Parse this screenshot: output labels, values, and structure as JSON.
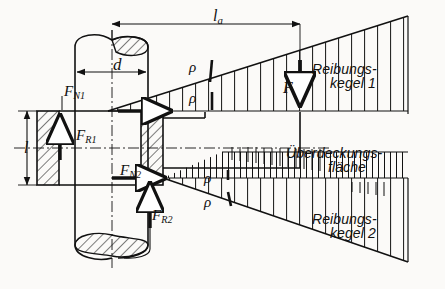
{
  "figure": {
    "kind": "technical-drawing",
    "background_color": "#fbfaf8",
    "line_color": "#111111"
  },
  "dimensions": {
    "la": {
      "text": "l",
      "sub": "a",
      "meaning": "Abstand / overhang length",
      "x": 213,
      "y": 12
    },
    "d": {
      "text": "d",
      "sub": "",
      "meaning": "Wellendurchmesser / shaft diameter",
      "x": 118,
      "y": 62
    },
    "l": {
      "text": "l",
      "sub": "",
      "meaning": "Nabenlaenge / hub length",
      "x": 26,
      "y": 146
    }
  },
  "forces": [
    {
      "id": "FN1",
      "text": "F",
      "sub": "N1",
      "x": 67,
      "y": 89,
      "meaning": "Normalkraft 1"
    },
    {
      "id": "FR1",
      "text": "F",
      "sub": "R1",
      "x": 79,
      "y": 133,
      "meaning": "Reibkraft 1"
    },
    {
      "id": "FN2",
      "text": "F",
      "sub": "N2",
      "x": 124,
      "y": 168,
      "meaning": "Normalkraft 2"
    },
    {
      "id": "FR2",
      "text": "F",
      "sub": "R2",
      "x": 154,
      "y": 213,
      "meaning": "Reibkraft 2"
    },
    {
      "id": "F",
      "text": "F",
      "sub": "",
      "x": 286,
      "y": 84,
      "meaning": "Aeussere Kraft / applied force"
    }
  ],
  "angles": [
    {
      "id": "rho-1",
      "symbol": "ρ",
      "x": 190,
      "y": 66
    },
    {
      "id": "rho-2",
      "symbol": "ρ",
      "x": 190,
      "y": 97
    },
    {
      "id": "rho-3",
      "symbol": "ρ",
      "x": 205,
      "y": 177
    },
    {
      "id": "rho-4",
      "symbol": "ρ",
      "x": 205,
      "y": 201
    }
  ],
  "annotations": [
    {
      "id": "reibungskegel-1",
      "line1": "Reibungs-",
      "line2": "kegel 1",
      "x": 315,
      "y": 70,
      "meaning": "friction cone 1"
    },
    {
      "id": "ueberdeckungsflaeche",
      "line1": "Überdeckungs-",
      "line2": "fläche",
      "x": 288,
      "y": 152,
      "meaning": "overlap area"
    },
    {
      "id": "reibungskegel-2",
      "line1": "Reibungs-",
      "line2": "kegel 2",
      "x": 315,
      "y": 222,
      "meaning": "friction cone 2"
    }
  ]
}
